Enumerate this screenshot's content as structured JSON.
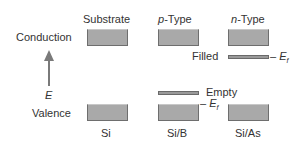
{
  "diagram": {
    "row_labels": {
      "conduction": "Conduction",
      "valence": "Valence",
      "energy_axis": "E"
    },
    "columns": [
      {
        "header": "Substrate",
        "header_italic_prefix": "",
        "header_suffix": "Substrate",
        "material": "Si"
      },
      {
        "header": "p-Type",
        "header_italic_prefix": "p",
        "header_suffix": "-Type",
        "material": "Si/B"
      },
      {
        "header": "n-Type",
        "header_italic_prefix": "n",
        "header_suffix": "-Type",
        "material": "Si/As"
      }
    ],
    "levels": {
      "filled": "Filled",
      "empty": "Empty",
      "fermi_prefix": "– ",
      "fermi_symbol": "E",
      "fermi_subscript": "f"
    },
    "colors": {
      "band_fill": "#a9a9a9",
      "band_border": "#6e6e6e",
      "arrow": "#7a7a7a",
      "text": "#333333"
    }
  }
}
